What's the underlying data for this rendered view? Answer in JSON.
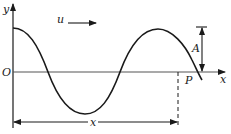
{
  "diagram": {
    "type": "transverse-wave",
    "labels": {
      "y_axis": "y",
      "x_axis": "x",
      "origin": "O",
      "velocity": "u",
      "amplitude": "A",
      "point": "P",
      "distance": "x"
    },
    "colors": {
      "stroke": "#1a1a1a",
      "axis": "#555555",
      "background": "#ffffff"
    }
  }
}
